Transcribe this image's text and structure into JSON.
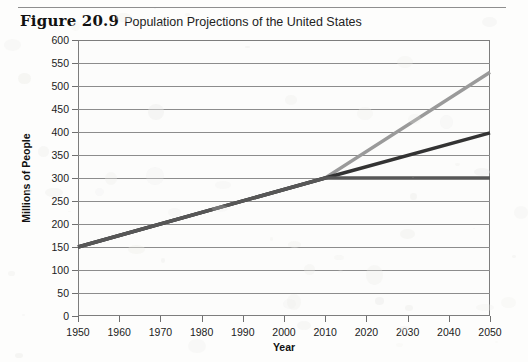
{
  "figure": {
    "label": "Figure 20.9",
    "title": "Population Projections of the United States"
  },
  "chart_data": {
    "type": "line",
    "title": "Population Projections of the United States",
    "xlabel": "Year",
    "ylabel": "Millions of People",
    "xlim": [
      1950,
      2050
    ],
    "ylim": [
      0,
      600
    ],
    "xticks": [
      "1950",
      "1960",
      "1970",
      "1980",
      "1990",
      "2000",
      "2010",
      "2020",
      "2030",
      "2040",
      "2050"
    ],
    "yticks": [
      "0",
      "50",
      "100",
      "150",
      "200",
      "250",
      "300",
      "350",
      "400",
      "450",
      "500",
      "550",
      "600"
    ],
    "grid": true,
    "legend": "none",
    "series": [
      {
        "name": "high-projection",
        "color": "#9a9a9a",
        "x": [
          1950,
          2010,
          2050
        ],
        "values": [
          150,
          300,
          530
        ]
      },
      {
        "name": "middle-projection",
        "color": "#333333",
        "x": [
          1950,
          2010,
          2050
        ],
        "values": [
          150,
          300,
          398
        ]
      },
      {
        "name": "low-projection",
        "color": "#575757",
        "x": [
          1950,
          2010,
          2050
        ],
        "values": [
          150,
          300,
          300
        ]
      }
    ]
  }
}
